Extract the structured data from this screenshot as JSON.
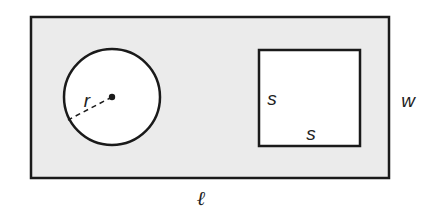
{
  "figure": {
    "width": 438,
    "height": 219,
    "background": "#ffffff",
    "stroke_color": "#1a1a1a",
    "fill_outer": "#ebebeb",
    "fill_inner": "#ffffff"
  },
  "outer_rectangle": {
    "x": 31,
    "y": 17,
    "width": 358,
    "height": 161,
    "stroke_width": 2.5
  },
  "circle": {
    "cx": 112,
    "cy": 97,
    "r": 48,
    "stroke_width": 2.5,
    "center_dot_r": 3.2
  },
  "radius_line": {
    "x1": 112,
    "y1": 97,
    "x2": 68,
    "y2": 120,
    "dash": "5,4"
  },
  "square": {
    "x": 259,
    "y": 50,
    "width": 101,
    "height": 96,
    "stroke_width": 2.5
  },
  "labels": {
    "radius": {
      "text": "r",
      "x": 87,
      "y": 100
    },
    "square_side_left": {
      "text": "s",
      "x": 272,
      "y": 98
    },
    "square_side_bottom": {
      "text": "s",
      "x": 311,
      "y": 133
    },
    "width": {
      "text": "w",
      "x": 408,
      "y": 100
    },
    "length": {
      "text": "ℓ",
      "x": 201,
      "y": 198
    }
  }
}
